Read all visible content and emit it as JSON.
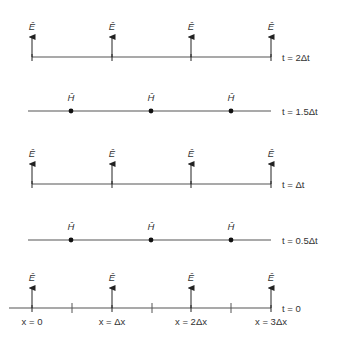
{
  "diagram": {
    "e_label": "Ê",
    "h_label": "Ĥ",
    "e_x_positions": [
      32,
      112,
      191,
      271
    ],
    "h_x_positions": [
      71,
      151,
      231
    ],
    "rows": [
      {
        "type": "E",
        "y": 57,
        "line_x1": 32,
        "line_x2": 271,
        "time_label": "t = 2Δt"
      },
      {
        "type": "H",
        "y": 111,
        "line_x1": 28,
        "line_x2": 271,
        "time_label": "t = 1.5Δt"
      },
      {
        "type": "E",
        "y": 184,
        "line_x1": 32,
        "line_x2": 271,
        "time_label": "t = Δt"
      },
      {
        "type": "H",
        "y": 240,
        "line_x1": 28,
        "line_x2": 271,
        "time_label": "t = 0.5Δt"
      },
      {
        "type": "E",
        "y": 308,
        "line_x1": 9,
        "line_x2": 271,
        "time_label": "t = 0",
        "ticks": [
          72,
          152,
          231
        ]
      }
    ],
    "x_labels": [
      "x = 0",
      "x = Δx",
      "x = 2Δx",
      "x = 3Δx"
    ],
    "colors": {
      "line": "#555555",
      "arrow": "#222222",
      "dot": "#111111",
      "text": "#333333"
    }
  }
}
